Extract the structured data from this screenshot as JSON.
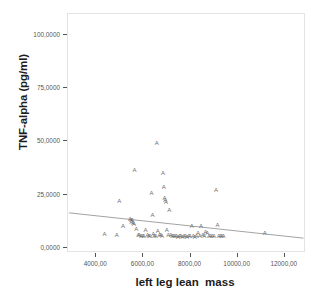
{
  "chart_data": {
    "type": "scatter",
    "title": "",
    "xlabel": "left leg lean  mass",
    "ylabel": "TNF-alpha (pg/ml)",
    "xlim": [
      2800,
      12900
    ],
    "ylim": [
      -2.5,
      110
    ],
    "xticks": [
      4000,
      6000,
      8000,
      10000,
      12000
    ],
    "xticklabels": [
      "4000,00",
      "6000,00",
      "8000,00",
      "10000,00",
      "12000,00"
    ],
    "yticks": [
      0,
      25,
      50,
      75,
      100
    ],
    "yticklabels": [
      "0,0000",
      "25,0000",
      "50,0000",
      "75,0000",
      "100,0000"
    ],
    "grid": false,
    "legend": false,
    "marker_glyph": "A",
    "marker_color": "#6b6b6b",
    "frame_color": "#e3e3e3",
    "fit_line": {
      "color": "#8a8a8a",
      "x_start": 2850,
      "y_start": 15.6,
      "x_end": 12880,
      "y_end": 3.6
    },
    "points": [
      {
        "x": 4350,
        "y": 6.4
      },
      {
        "x": 4870,
        "y": 6.2
      },
      {
        "x": 4980,
        "y": 22.1
      },
      {
        "x": 5130,
        "y": 10.2
      },
      {
        "x": 5430,
        "y": 13.4
      },
      {
        "x": 5470,
        "y": 12.9
      },
      {
        "x": 5500,
        "y": 12.2
      },
      {
        "x": 5530,
        "y": 13.0
      },
      {
        "x": 5560,
        "y": 11.8
      },
      {
        "x": 5600,
        "y": 11.2
      },
      {
        "x": 5620,
        "y": 36.6
      },
      {
        "x": 5700,
        "y": 8.6
      },
      {
        "x": 5780,
        "y": 5.9
      },
      {
        "x": 5820,
        "y": 6.0
      },
      {
        "x": 5900,
        "y": 5.6
      },
      {
        "x": 5960,
        "y": 5.4
      },
      {
        "x": 6020,
        "y": 5.3
      },
      {
        "x": 6090,
        "y": 8.4
      },
      {
        "x": 6170,
        "y": 6.2
      },
      {
        "x": 6230,
        "y": 5.5
      },
      {
        "x": 6280,
        "y": 5.4
      },
      {
        "x": 6340,
        "y": 25.9
      },
      {
        "x": 6390,
        "y": 15.4
      },
      {
        "x": 6420,
        "y": 6.3
      },
      {
        "x": 6460,
        "y": 5.7
      },
      {
        "x": 6520,
        "y": 5.5
      },
      {
        "x": 6570,
        "y": 49.5
      },
      {
        "x": 6610,
        "y": 7.7
      },
      {
        "x": 6680,
        "y": 6.0
      },
      {
        "x": 6740,
        "y": 5.8
      },
      {
        "x": 6790,
        "y": 5.4
      },
      {
        "x": 6830,
        "y": 35.0
      },
      {
        "x": 6860,
        "y": 28.4
      },
      {
        "x": 6900,
        "y": 23.4
      },
      {
        "x": 6930,
        "y": 22.4
      },
      {
        "x": 6960,
        "y": 21.6
      },
      {
        "x": 6990,
        "y": 8.2
      },
      {
        "x": 7050,
        "y": 6.1
      },
      {
        "x": 7100,
        "y": 17.6
      },
      {
        "x": 7160,
        "y": 5.9
      },
      {
        "x": 7220,
        "y": 5.6
      },
      {
        "x": 7280,
        "y": 5.4
      },
      {
        "x": 7340,
        "y": 5.3
      },
      {
        "x": 7400,
        "y": 5.5
      },
      {
        "x": 7470,
        "y": 5.2
      },
      {
        "x": 7530,
        "y": 5.4
      },
      {
        "x": 7590,
        "y": 5.3
      },
      {
        "x": 7660,
        "y": 5.2
      },
      {
        "x": 7720,
        "y": 5.4
      },
      {
        "x": 7790,
        "y": 5.3
      },
      {
        "x": 7850,
        "y": 5.2
      },
      {
        "x": 7920,
        "y": 5.5
      },
      {
        "x": 7980,
        "y": 5.3
      },
      {
        "x": 8050,
        "y": 10.1
      },
      {
        "x": 8120,
        "y": 5.4
      },
      {
        "x": 8180,
        "y": 5.2
      },
      {
        "x": 8250,
        "y": 5.6
      },
      {
        "x": 8320,
        "y": 7.0
      },
      {
        "x": 8390,
        "y": 5.3
      },
      {
        "x": 8450,
        "y": 10.2
      },
      {
        "x": 8520,
        "y": 6.2
      },
      {
        "x": 8580,
        "y": 5.4
      },
      {
        "x": 8640,
        "y": 7.2
      },
      {
        "x": 8710,
        "y": 7.0
      },
      {
        "x": 8780,
        "y": 5.6
      },
      {
        "x": 8850,
        "y": 5.4
      },
      {
        "x": 8920,
        "y": 5.3
      },
      {
        "x": 9000,
        "y": 5.5
      },
      {
        "x": 9080,
        "y": 27.0
      },
      {
        "x": 9140,
        "y": 10.8
      },
      {
        "x": 9200,
        "y": 5.4
      },
      {
        "x": 9270,
        "y": 5.3
      },
      {
        "x": 9330,
        "y": 5.6
      },
      {
        "x": 9400,
        "y": 5.4
      },
      {
        "x": 11150,
        "y": 7.1
      }
    ]
  }
}
